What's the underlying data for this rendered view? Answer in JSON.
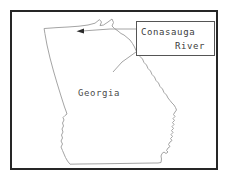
{
  "figure": {
    "type": "outline-map",
    "background_color": "#ffffff",
    "frame_color": "#262626",
    "outline_color": "#9a9a9a"
  },
  "map": {
    "state_label": "Georgia",
    "outline_name": "georgia-state-outline"
  },
  "callout": {
    "line1": "Conasauga",
    "line2": "River",
    "border_color": "#555555",
    "leader_line_color": "#8d8d8d",
    "arrow_color": "#2b2b2b"
  }
}
